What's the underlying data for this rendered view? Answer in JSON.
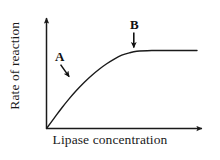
{
  "figure": {
    "background_color": "#ffffff",
    "ink_color": "#1a1a1a",
    "width": 220,
    "height": 160
  },
  "chart_data": {
    "type": "line",
    "title": "",
    "subtitle": "",
    "xlabel": "Lipase concentration",
    "ylabel": "Rate of reaction",
    "x_tick_labels": [],
    "y_tick_labels": [],
    "grid": false,
    "legend": null,
    "legend_position": "none",
    "axis_style": "arrow-headed L-shaped axes, no tick marks, no numeric scale",
    "xlim": [
      0,
      1
    ],
    "ylim": [
      0,
      1
    ],
    "series": [
      {
        "name": "Rate of reaction vs lipase concentration",
        "shape": "saturation curve (rises steeply then plateaus)",
        "color": "#1a1a1a",
        "x": [
          0.0,
          0.05,
          0.1,
          0.15,
          0.2,
          0.25,
          0.3,
          0.35,
          0.4,
          0.45,
          0.5,
          0.55,
          0.6,
          0.7,
          0.8,
          0.9,
          1.0
        ],
        "y": [
          0.0,
          0.13,
          0.26,
          0.38,
          0.49,
          0.59,
          0.68,
          0.76,
          0.83,
          0.89,
          0.94,
          0.97,
          0.99,
          1.0,
          1.0,
          1.0,
          1.0
        ]
      }
    ],
    "annotations": [
      {
        "label": "A",
        "description": "arrow pointing to the steeply rising part of the curve",
        "arrow": "diagonal down-right",
        "target_x": 0.16,
        "target_y": 0.64
      },
      {
        "label": "B",
        "description": "arrow pointing to the plateau of the curve",
        "arrow": "vertical down",
        "target_x": 0.58,
        "target_y": 1.0
      }
    ]
  },
  "axes": {
    "x_axis_label": "Lipase concentration",
    "y_axis_label": "Rate of reaction"
  },
  "markers": {
    "a": "A",
    "b": "B"
  }
}
